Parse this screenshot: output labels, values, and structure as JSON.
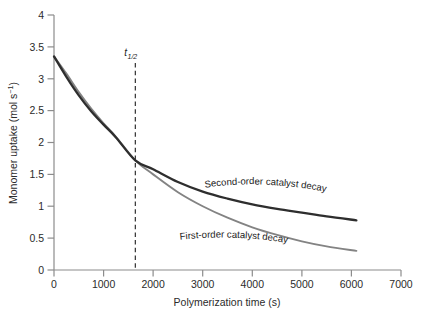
{
  "chart_data": {
    "type": "line",
    "title": "",
    "xlabel": "Polymerization time (s)",
    "ylabel": "Monomer uptake (mol s−1)",
    "ylabel_base": "Monomer uptake (mol s",
    "ylabel_sup": "−1",
    "ylabel_tail": ")",
    "xlim": [
      0,
      7000
    ],
    "ylim": [
      0,
      4
    ],
    "grid": false,
    "legend_position": "inline-curve-labels",
    "xticks": [
      0,
      1000,
      2000,
      3000,
      4000,
      5000,
      6000,
      7000
    ],
    "xtick_labels": [
      "0",
      "1000",
      "2000",
      "3000",
      "4000",
      "5000",
      "6000",
      "7000"
    ],
    "yticks": [
      0,
      0.5,
      1,
      1.5,
      2,
      2.5,
      3,
      3.5,
      4
    ],
    "ytick_labels": [
      "0",
      "0.5",
      "1",
      "1.5",
      "2",
      "2.5",
      "3",
      "3.5",
      "4"
    ],
    "annotations": [
      {
        "name": "half-life-marker",
        "text": "t1/2",
        "text_main": "t",
        "text_sub": "1/2",
        "x": 1640,
        "style": "dashed vertical line",
        "color": "#1c1c1c"
      }
    ],
    "series": [
      {
        "name": "Second-order catalyst decay",
        "label": "Second-order catalyst decay",
        "color": "#2e2e2e",
        "x": [
          0,
          250,
          500,
          750,
          1000,
          1250,
          1640,
          2000,
          2500,
          3000,
          3500,
          4000,
          4500,
          5000,
          5500,
          6100
        ],
        "values": [
          3.35,
          3.03,
          2.74,
          2.49,
          2.28,
          2.08,
          1.72,
          1.58,
          1.38,
          1.23,
          1.12,
          1.03,
          0.96,
          0.9,
          0.84,
          0.78
        ]
      },
      {
        "name": "First-order catalyst decay",
        "label": "First-order catalyst decay",
        "color": "#838383",
        "x": [
          0,
          250,
          500,
          750,
          1000,
          1250,
          1640,
          2000,
          2500,
          3000,
          3500,
          4000,
          4500,
          5000,
          5500,
          6100
        ],
        "values": [
          3.35,
          3.08,
          2.79,
          2.53,
          2.3,
          2.09,
          1.72,
          1.5,
          1.22,
          1.0,
          0.82,
          0.67,
          0.55,
          0.45,
          0.37,
          0.3
        ]
      }
    ]
  }
}
